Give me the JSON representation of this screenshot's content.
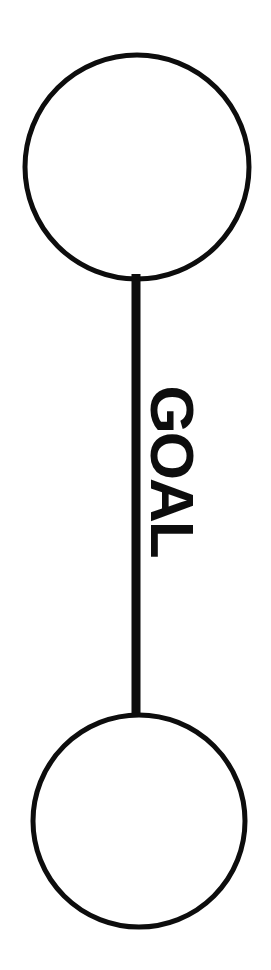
{
  "canvas": {
    "width": 271,
    "height": 970,
    "background_color": "#ffffff",
    "ink_color": "#0d0d0d"
  },
  "diagram": {
    "type": "node-edge-graph",
    "nodes": [
      {
        "id": "node-top",
        "name": "top-node-circle",
        "shape": "circle",
        "label": "",
        "cx": 137,
        "cy": 167,
        "r": 112,
        "stroke_width": 5,
        "fill": "none",
        "stroke": "#0d0d0d"
      },
      {
        "id": "node-bottom",
        "name": "bottom-node-circle",
        "shape": "circle",
        "label": "",
        "cx": 139,
        "cy": 821,
        "r": 106,
        "stroke_width": 5,
        "fill": "none",
        "stroke": "#0d0d0d"
      }
    ],
    "edges": [
      {
        "id": "edge-goal",
        "name": "goal-edge",
        "from": "node-top",
        "to": "node-bottom",
        "label": "GOAL",
        "label_rotation_deg": 90,
        "label_x": 172,
        "label_y": 471,
        "x": 136,
        "y1": 274,
        "y2": 716,
        "stroke_width": 9,
        "stroke": "#0d0d0d"
      }
    ]
  }
}
